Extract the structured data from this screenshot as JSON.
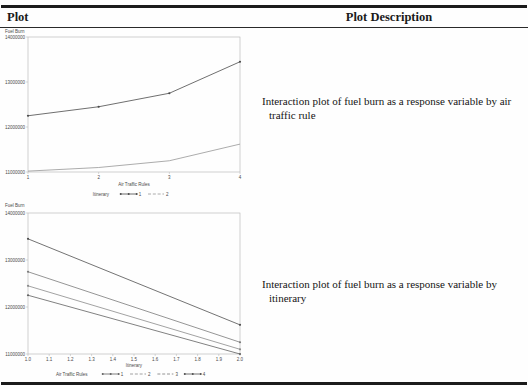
{
  "table": {
    "header": {
      "plot": "Plot",
      "description": "Plot Description"
    },
    "rows": [
      {
        "description_lines": [
          "Interaction plot of fuel burn as a response variable by air",
          "traffic rule"
        ]
      },
      {
        "description_lines": [
          "Interaction plot of fuel burn as a response variable by",
          "itinerary"
        ]
      }
    ]
  },
  "style": {
    "rule_color": "#1b1b1b",
    "header_line_color": "#2a2a2a",
    "chart_text_color": "#4a4a4a",
    "chart_axis_color": "#b2b2b2",
    "background": "#fefefe"
  },
  "chart_data": [
    {
      "type": "line",
      "title": "",
      "ylabel": "Fuel Burn",
      "xlabel": "Air Traffic Rules",
      "x": [
        1,
        2,
        3,
        4
      ],
      "xticks": [
        "1",
        "2",
        "3",
        "4"
      ],
      "yticks": [
        "14000000",
        "13000000",
        "12000000",
        "11000000"
      ],
      "ylim": [
        11000000,
        14000000
      ],
      "xlim": [
        1,
        4
      ],
      "grid": false,
      "legend": {
        "title": "Itinerary",
        "position": "bottom",
        "entries": [
          {
            "label": "1",
            "sample": "dots"
          },
          {
            "label": "2",
            "sample": "dash"
          }
        ]
      },
      "series": [
        {
          "name": "Itinerary 1",
          "values": [
            12250000,
            12450000,
            12750000,
            13450000
          ],
          "color": "#4a4a4a",
          "marker": true
        },
        {
          "name": "Itinerary 2",
          "values": [
            11020000,
            11100000,
            11250000,
            11620000
          ],
          "color": "#979797",
          "marker": false
        }
      ]
    },
    {
      "type": "line",
      "title": "",
      "ylabel": "Fuel Burn",
      "xlabel": "Itinerary",
      "x": [
        1,
        2
      ],
      "xticks": [
        "1.0",
        "1.1",
        "1.2",
        "1.3",
        "1.4",
        "1.5",
        "1.6",
        "1.7",
        "1.8",
        "1.9",
        "2.0"
      ],
      "yticks": [
        "14000000",
        "13000000",
        "12000000",
        "11000000"
      ],
      "ylim": [
        11000000,
        14000000
      ],
      "xlim": [
        1,
        2
      ],
      "grid": false,
      "legend": {
        "title": "Air Traffic Rules",
        "position": "bottom",
        "entries": [
          {
            "label": "1",
            "sample": "dots"
          },
          {
            "label": "2",
            "sample": "dash"
          },
          {
            "label": "3",
            "sample": "dash"
          },
          {
            "label": "4",
            "sample": "dots"
          }
        ]
      },
      "series": [
        {
          "name": "Air Traffic Rule 1",
          "values": [
            12250000,
            11000000
          ],
          "color": "#616161",
          "marker": true
        },
        {
          "name": "Air Traffic Rule 2",
          "values": [
            12450000,
            11100000
          ],
          "color": "#8a8a8a",
          "marker": true
        },
        {
          "name": "Air Traffic Rule 3",
          "values": [
            12750000,
            11250000
          ],
          "color": "#7a7a7a",
          "marker": true
        },
        {
          "name": "Air Traffic Rule 4",
          "values": [
            13450000,
            11620000
          ],
          "color": "#4f4f4f",
          "marker": true
        }
      ]
    }
  ]
}
